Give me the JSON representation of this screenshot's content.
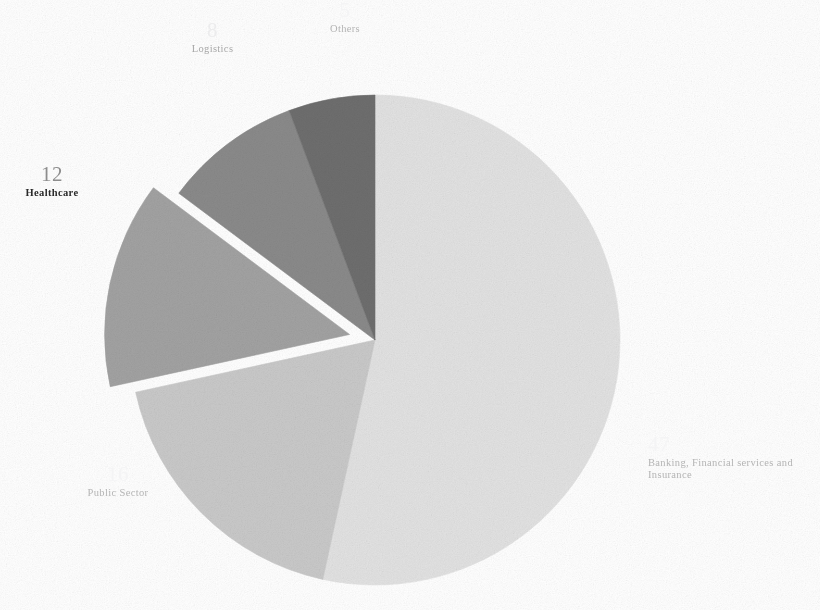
{
  "chart_data": {
    "type": "pie",
    "title": "",
    "subtitle": "",
    "xlabel": "",
    "ylabel": "",
    "legend_position": "none",
    "grid": false,
    "label_format": "value above category name",
    "start_angle_deg": 0,
    "direction": "clockwise",
    "center_px": [
      375,
      340
    ],
    "radius_px": 245,
    "total": 88,
    "categories": [
      "Banking, Financial services and Insurance",
      "Public Sector",
      "Healthcare",
      "Logistics",
      "Others"
    ],
    "values": [
      47,
      16,
      12,
      8,
      5
    ],
    "colors": [
      "#e2e2e2",
      "#c9c9c9",
      "#a2a2a2",
      "#8a8a8a",
      "#6e6e6e"
    ],
    "exploded": [
      "Healthcare"
    ],
    "slices": [
      {
        "name": "Banking, Financial services and Insurance",
        "value": 47,
        "color": "#e2e2e2",
        "start_deg": 0,
        "end_deg": 192.3,
        "exploded": false
      },
      {
        "name": "Public Sector",
        "value": 16,
        "color": "#c9c9c9",
        "start_deg": 192.3,
        "end_deg": 257.7,
        "exploded": false
      },
      {
        "name": "Healthcare",
        "value": 12,
        "color": "#a2a2a2",
        "start_deg": 257.7,
        "end_deg": 306.8,
        "exploded": true
      },
      {
        "name": "Logistics",
        "value": 8,
        "color": "#8a8a8a",
        "start_deg": 306.8,
        "end_deg": 339.5,
        "exploded": false
      },
      {
        "name": "Others",
        "value": 5,
        "color": "#6e6e6e",
        "start_deg": 339.5,
        "end_deg": 360,
        "exploded": false
      }
    ]
  },
  "labels": {
    "others": {
      "value": "5",
      "name": "Others"
    },
    "logistics": {
      "value": "8",
      "name": "Logistics"
    },
    "healthcare": {
      "value": "12",
      "name": "Healthcare"
    },
    "public": {
      "value": "16",
      "name": "Public Sector"
    },
    "bfsi": {
      "value": "47",
      "name": "Banking, Financial services and Insurance"
    }
  }
}
